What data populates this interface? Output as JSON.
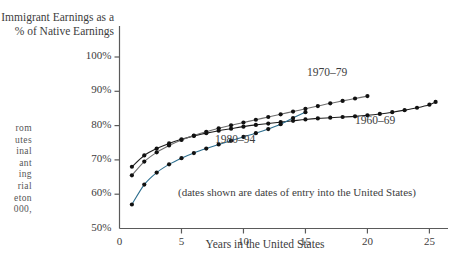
{
  "chart_data": {
    "type": "line",
    "title": "Immigrant Earnings as a\n% of Native Earnings",
    "xlabel": "Years in the United States",
    "ylabel": "Immigrant Earnings as a % of Native Earnings",
    "note": "(dates shown are dates of entry into the United States)",
    "xlim": [
      0,
      26.5
    ],
    "ylim": [
      50,
      100
    ],
    "xticks": [
      0,
      5,
      10,
      15,
      20,
      25
    ],
    "xtick_labels": [
      "0",
      "5",
      "10",
      "15",
      "20",
      "25"
    ],
    "yticks": [
      50,
      60,
      70,
      80,
      90,
      100
    ],
    "ytick_labels": [
      "50%",
      "60%",
      "70%",
      "80%",
      "90%",
      "100%"
    ],
    "grid": false,
    "legend_position": "inline-annotations",
    "series": [
      {
        "name": "1960-69",
        "label": "1960–69",
        "color": "#1f1f1f",
        "x": [
          1,
          2,
          3,
          4,
          5,
          6,
          7,
          8,
          9,
          10,
          11,
          12,
          13,
          14,
          15,
          16,
          17,
          18,
          19,
          20,
          21,
          22,
          23,
          24,
          25,
          25.5
        ],
        "values": [
          68.0,
          71.3,
          73.3,
          74.8,
          76.0,
          77.0,
          77.8,
          78.5,
          79.1,
          79.7,
          80.2,
          80.6,
          81.0,
          81.4,
          81.8,
          82.1,
          82.3,
          82.5,
          82.7,
          83.0,
          83.4,
          83.9,
          84.5,
          85.2,
          86.1,
          86.9
        ]
      },
      {
        "name": "1970-79",
        "label": "1970–79",
        "color": "#6e6e6e",
        "x": [
          1,
          2,
          3,
          4,
          5,
          6,
          7,
          8,
          9,
          10,
          11,
          12,
          13,
          14,
          15,
          16,
          17,
          18,
          19,
          20
        ],
        "values": [
          65.5,
          69.5,
          72.2,
          74.2,
          75.8,
          77.1,
          78.2,
          79.2,
          80.1,
          80.9,
          81.7,
          82.5,
          83.3,
          84.1,
          84.9,
          85.7,
          86.5,
          87.2,
          87.9,
          88.6
        ]
      },
      {
        "name": "1980-94",
        "label": "1980–94",
        "color": "#2d6e8e",
        "x": [
          1,
          2,
          3,
          4,
          5,
          6,
          7,
          8,
          9,
          10,
          11,
          12,
          13,
          14,
          15
        ],
        "values": [
          57.0,
          62.8,
          66.3,
          68.7,
          70.5,
          72.0,
          73.3,
          74.5,
          75.6,
          76.7,
          77.8,
          79.0,
          80.4,
          82.2,
          83.9
        ]
      }
    ],
    "series_label_positions": [
      {
        "name": "1970-79",
        "left": 307,
        "top": 66
      },
      {
        "name": "1960-69",
        "left": 355,
        "top": 114
      },
      {
        "name": "1980-94",
        "left": 215,
        "top": 133
      }
    ]
  },
  "margin_caption": {
    "lines": [
      "rom",
      "utes",
      "inal",
      "ant",
      "ing",
      "rial",
      "eton",
      "000,"
    ]
  }
}
